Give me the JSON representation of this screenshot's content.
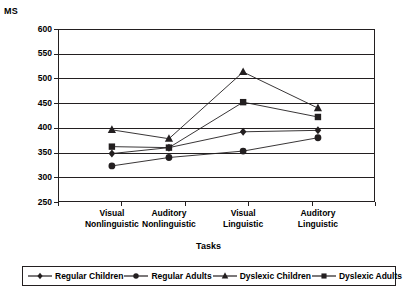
{
  "chart_data": {
    "type": "line",
    "title": "",
    "ylabel": "MS",
    "xlabel": "Tasks",
    "ylim": [
      250,
      600
    ],
    "ytick_step": 50,
    "yticks": [
      600,
      550,
      500,
      450,
      400,
      350,
      300,
      250
    ],
    "grid": true,
    "legend_position": "bottom",
    "categories": [
      "Visual\nNonlinguistic",
      "Auditory\nNonlinguistic",
      "Visual\nLinguistic",
      "Auditory\nLinguistic"
    ],
    "category_lines": [
      [
        "Visual",
        "Nonlinguistic"
      ],
      [
        "Auditory",
        "Nonlinguistic"
      ],
      [
        "Visual",
        "Linguistic"
      ],
      [
        "Auditory",
        "Linguistic"
      ]
    ],
    "series": [
      {
        "name": "Regular Children",
        "marker": "diamond",
        "values": [
          348,
          360,
          392,
          395
        ]
      },
      {
        "name": "Regular Adults",
        "marker": "circle",
        "values": [
          323,
          340,
          353,
          380
        ]
      },
      {
        "name": "Dyslexic Children",
        "marker": "triangle",
        "values": [
          396,
          378,
          513,
          440
        ]
      },
      {
        "name": "Dyslexic Adults",
        "marker": "square",
        "values": [
          362,
          360,
          452,
          422
        ]
      }
    ],
    "line_color": "#231f20",
    "marker_color": "#231f20"
  },
  "axis": {
    "y_label": "MS",
    "x_label": "Tasks"
  }
}
